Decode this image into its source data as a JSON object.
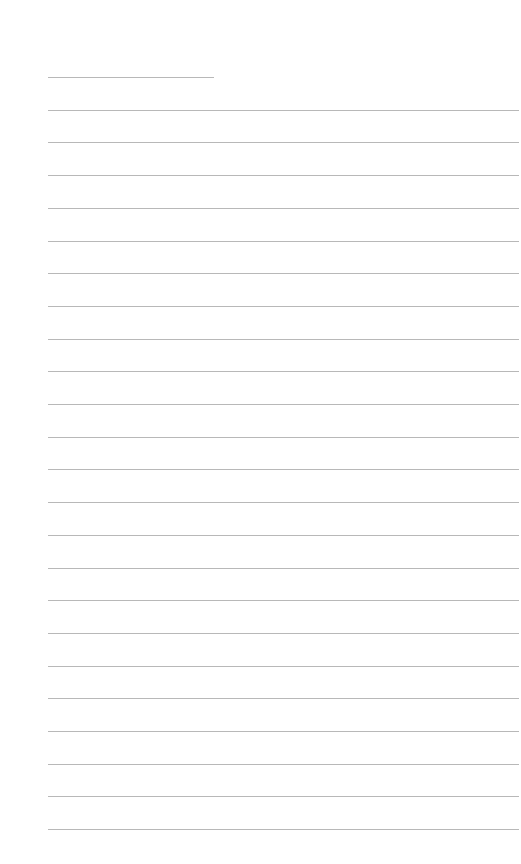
{
  "page": {
    "type": "lined-paper",
    "background": "#ffffff",
    "line_color": "#b8b8b8",
    "left_margin_px": 48,
    "first_line_y": 77,
    "line_spacing_px": 32.7,
    "lines": [
      {
        "kind": "short",
        "width": 166
      },
      {
        "kind": "full"
      },
      {
        "kind": "full"
      },
      {
        "kind": "full"
      },
      {
        "kind": "full"
      },
      {
        "kind": "full"
      },
      {
        "kind": "full"
      },
      {
        "kind": "full"
      },
      {
        "kind": "full"
      },
      {
        "kind": "full"
      },
      {
        "kind": "full"
      },
      {
        "kind": "full"
      },
      {
        "kind": "full"
      },
      {
        "kind": "full"
      },
      {
        "kind": "full"
      },
      {
        "kind": "full"
      },
      {
        "kind": "full"
      },
      {
        "kind": "full"
      },
      {
        "kind": "full"
      },
      {
        "kind": "full"
      },
      {
        "kind": "full"
      },
      {
        "kind": "full"
      },
      {
        "kind": "full"
      },
      {
        "kind": "full"
      }
    ]
  }
}
